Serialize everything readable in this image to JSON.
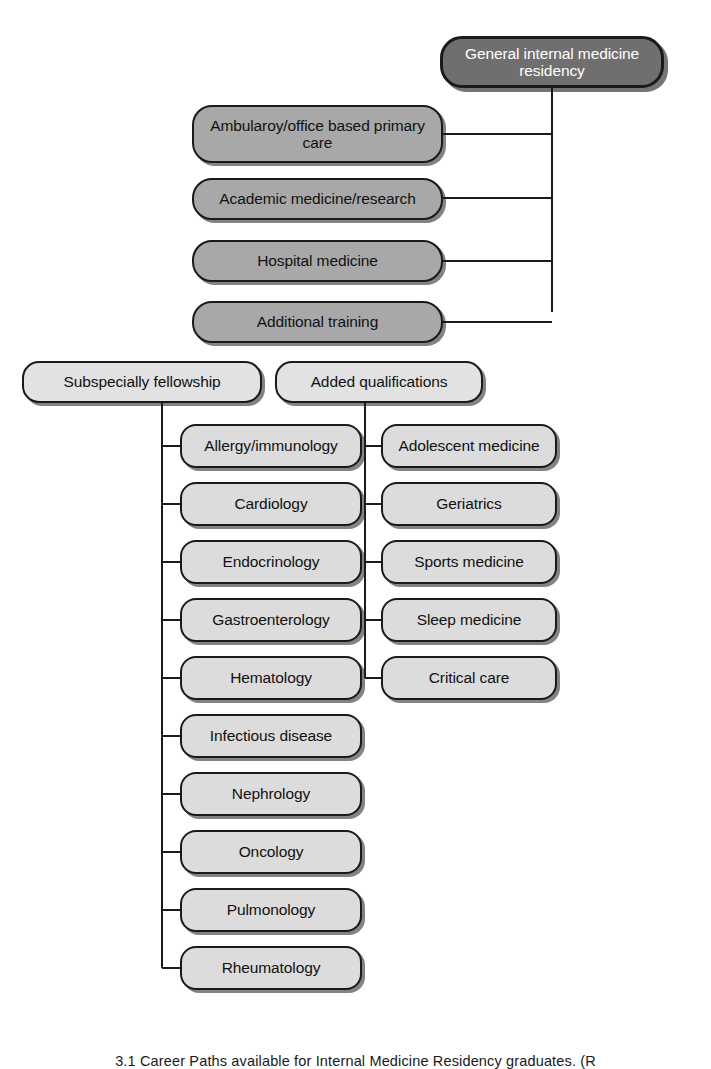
{
  "figure": {
    "title": "Career paths available for Internal Medicine Residency graduates",
    "caption": "3.1  Career Paths available for Internal Medicine Residency graduates. (R",
    "colors": {
      "root_fill": "#6f6f6f",
      "root_text": "#ffffff",
      "mid_fill": "#a8a8a8",
      "light_fill": "#dcdcdc",
      "header_fill": "#e2e2e2",
      "line": "#1c1c1c",
      "text": "#111111",
      "background": "#ffffff"
    }
  },
  "root": {
    "label": "General internal medicine residency"
  },
  "career_paths": [
    {
      "label": "Ambularoy/office based primary care"
    },
    {
      "label": "Academic medicine/research"
    },
    {
      "label": "Hospital medicine"
    },
    {
      "label": "Additional training"
    }
  ],
  "branches": [
    {
      "header": "Subspecially fellowship",
      "items": [
        {
          "label": "Allergy/immunology"
        },
        {
          "label": "Cardiology"
        },
        {
          "label": "Endocrinology"
        },
        {
          "label": "Gastroenterology"
        },
        {
          "label": "Hematology"
        },
        {
          "label": "Infectious disease"
        },
        {
          "label": "Nephrology"
        },
        {
          "label": "Oncology"
        },
        {
          "label": "Pulmonology"
        },
        {
          "label": "Rheumatology"
        }
      ]
    },
    {
      "header": "Added qualifications",
      "items": [
        {
          "label": "Adolescent medicine"
        },
        {
          "label": "Geriatrics"
        },
        {
          "label": "Sports medicine"
        },
        {
          "label": "Sleep medicine"
        },
        {
          "label": "Critical care"
        }
      ]
    }
  ]
}
